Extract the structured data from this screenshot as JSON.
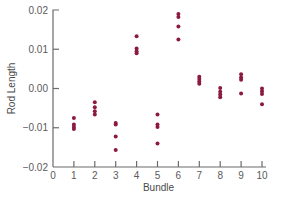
{
  "chart_data": {
    "type": "scatter",
    "title": "",
    "xlabel": "Bundle",
    "ylabel": "Rod Length",
    "xlim": [
      0,
      10
    ],
    "ylim": [
      -0.02,
      0.02
    ],
    "x_ticks": [
      0,
      1,
      2,
      3,
      4,
      5,
      6,
      7,
      8,
      9,
      10
    ],
    "x_tick_labels": [
      "0",
      "1",
      "2",
      "3",
      "4",
      "5",
      "6",
      "7",
      "8",
      "9",
      "10"
    ],
    "y_ticks": [
      0.02,
      0.01,
      0.0,
      -0.01,
      -0.02
    ],
    "y_tick_labels": [
      "0.02",
      "0.01",
      "0.00",
      "−0.01",
      "−0.02"
    ],
    "grid": false,
    "legend": null,
    "marker_color": "#8b1a3f",
    "series": [
      {
        "name": "Rod Length by Bundle",
        "points": [
          {
            "x": 1,
            "y": -0.0075
          },
          {
            "x": 1,
            "y": -0.0092
          },
          {
            "x": 1,
            "y": -0.0098
          },
          {
            "x": 1,
            "y": -0.0103
          },
          {
            "x": 2,
            "y": -0.0035
          },
          {
            "x": 2,
            "y": -0.0048
          },
          {
            "x": 2,
            "y": -0.0058
          },
          {
            "x": 2,
            "y": -0.0066
          },
          {
            "x": 3,
            "y": -0.0088
          },
          {
            "x": 3,
            "y": -0.0092
          },
          {
            "x": 3,
            "y": -0.0122
          },
          {
            "x": 3,
            "y": -0.0157
          },
          {
            "x": 4,
            "y": 0.0133
          },
          {
            "x": 4,
            "y": 0.0102
          },
          {
            "x": 4,
            "y": 0.0095
          },
          {
            "x": 4,
            "y": 0.009
          },
          {
            "x": 5,
            "y": -0.0066
          },
          {
            "x": 5,
            "y": -0.0092
          },
          {
            "x": 5,
            "y": -0.0098
          },
          {
            "x": 5,
            "y": -0.014
          },
          {
            "x": 6,
            "y": 0.019
          },
          {
            "x": 6,
            "y": 0.0182
          },
          {
            "x": 6,
            "y": 0.0158
          },
          {
            "x": 6,
            "y": 0.0125
          },
          {
            "x": 7,
            "y": 0.003
          },
          {
            "x": 7,
            "y": 0.0024
          },
          {
            "x": 7,
            "y": 0.0018
          },
          {
            "x": 7,
            "y": 0.0012
          },
          {
            "x": 8,
            "y": 0.0001
          },
          {
            "x": 8,
            "y": -0.0008
          },
          {
            "x": 8,
            "y": -0.0015
          },
          {
            "x": 8,
            "y": -0.0022
          },
          {
            "x": 9,
            "y": 0.0036
          },
          {
            "x": 9,
            "y": 0.0028
          },
          {
            "x": 9,
            "y": 0.0022
          },
          {
            "x": 9,
            "y": -0.0013
          },
          {
            "x": 10,
            "y": 0.0
          },
          {
            "x": 10,
            "y": -0.0007
          },
          {
            "x": 10,
            "y": -0.0014
          },
          {
            "x": 10,
            "y": -0.004
          }
        ]
      }
    ]
  },
  "layout": {
    "plot_left": 53,
    "plot_right": 266,
    "plot_top": 10,
    "plot_bottom": 167,
    "x_unit_px": 20.9,
    "y_unit_px": 3925
  }
}
